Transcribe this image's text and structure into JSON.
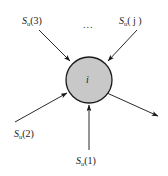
{
  "figure": {
    "title": "",
    "background_color": "#ffffff",
    "node": {
      "label": "i",
      "fill_color": "#c8c8c8",
      "stroke_color": "#1a1a1a",
      "center_x": 89,
      "center_y": 80,
      "radius": 23
    },
    "ellipsis": {
      "text": "...",
      "x": 83,
      "y": 22
    },
    "inputs": [
      {
        "id": "input-3",
        "symbol": "S",
        "subscript": "u",
        "argument": "(3)",
        "label_x": 22,
        "label_y": 16,
        "arrow": {
          "x1": 39,
          "y1": 30,
          "x2": 71,
          "y2": 62
        },
        "direction": "incoming"
      },
      {
        "id": "input-j",
        "symbol": "S",
        "subscript": "u",
        "argument": "( j )",
        "label_x": 120,
        "label_y": 16,
        "arrow": {
          "x1": 137,
          "y1": 30,
          "x2": 107,
          "y2": 62
        },
        "direction": "incoming"
      },
      {
        "id": "input-2",
        "symbol": "S",
        "subscript": "u",
        "argument": "(2)",
        "label_x": 14,
        "label_y": 129,
        "arrow": {
          "x1": 16,
          "y1": 121,
          "x2": 68,
          "y2": 92
        },
        "direction": "incoming"
      },
      {
        "id": "input-1",
        "symbol": "S",
        "subscript": "u",
        "argument": "(1)",
        "label_x": 77,
        "label_y": 156,
        "arrow": {
          "x1": 89,
          "y1": 150,
          "x2": 89,
          "y2": 106
        },
        "direction": "incoming"
      }
    ],
    "outputs": [
      {
        "id": "output-1",
        "arrow": {
          "x1": 108,
          "y1": 94,
          "x2": 159,
          "y2": 117
        },
        "direction": "outgoing"
      }
    ]
  }
}
